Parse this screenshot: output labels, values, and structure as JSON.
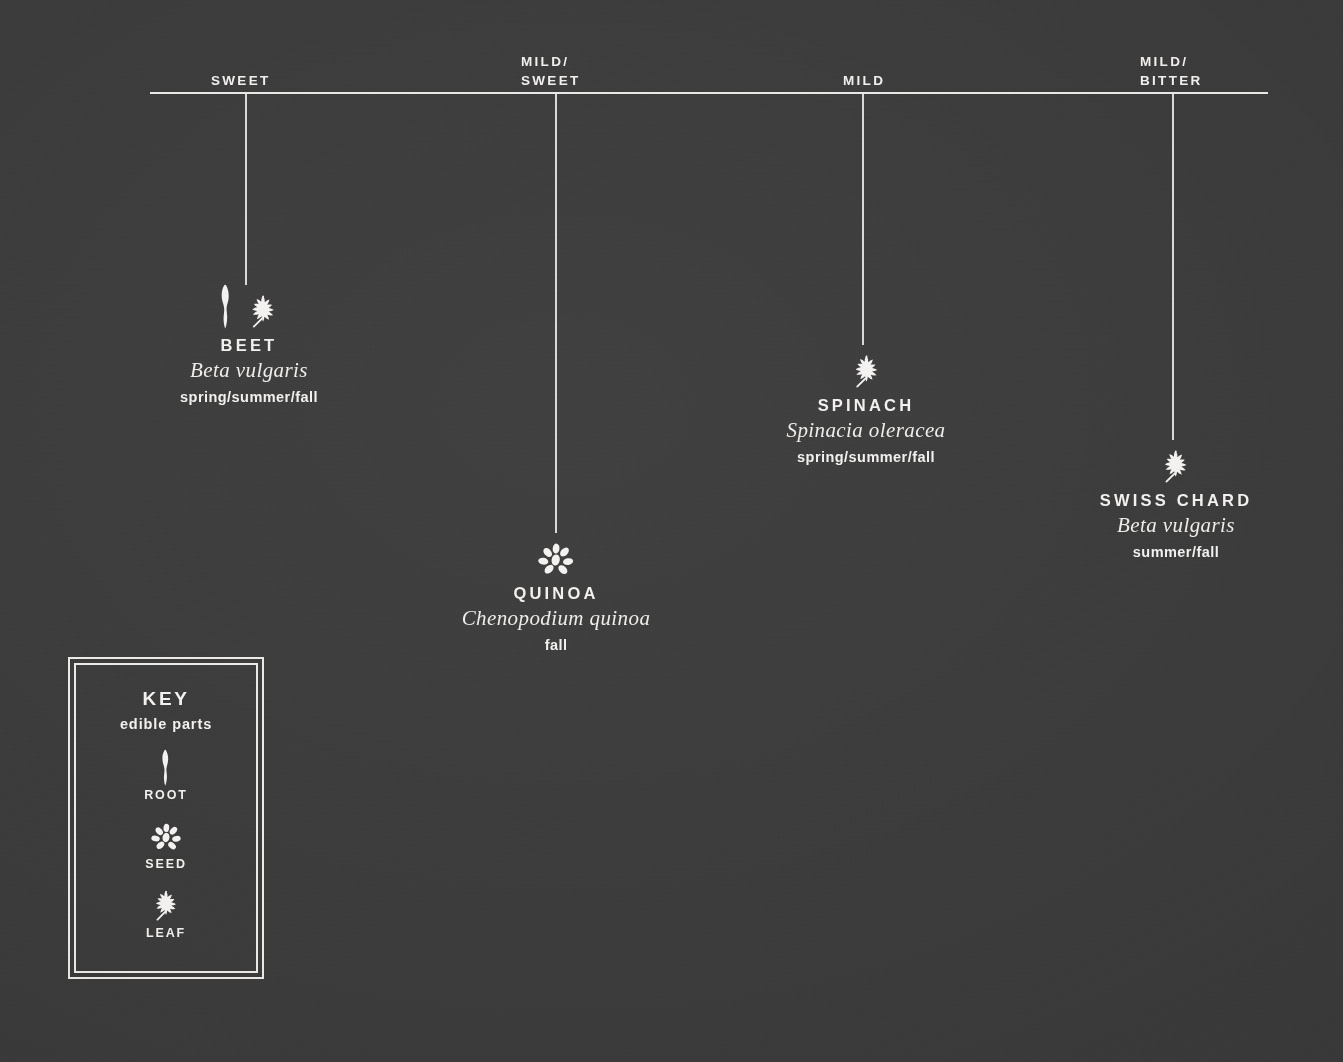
{
  "palette": {
    "background": "#3b3b3b",
    "ink": "#f2f1ef",
    "rule": "#e8e8e6"
  },
  "axis": {
    "name": "flavor-axis",
    "labels": [
      {
        "id": "sweet",
        "text": "SWEET",
        "line1": "SWEET",
        "line2": ""
      },
      {
        "id": "mild-sweet",
        "text": "MILD/ SWEET",
        "line1": "MILD/",
        "line2": "SWEET"
      },
      {
        "id": "mild",
        "text": "MILD",
        "line1": "MILD",
        "line2": ""
      },
      {
        "id": "mild-bitter",
        "text": "MILD/ BITTER",
        "line1": "MILD/",
        "line2": "BITTER"
      }
    ]
  },
  "entries": [
    {
      "id": "beet",
      "common": "BEET",
      "latin": "Beta vulgaris",
      "season": "spring/summer/fall",
      "flavor": "SWEET",
      "icons": [
        "root-icon",
        "leaf-icon"
      ]
    },
    {
      "id": "quinoa",
      "common": "QUINOA",
      "latin": "Chenopodium quinoa",
      "season": "fall",
      "flavor": "MILD/ SWEET",
      "icons": [
        "seed-icon"
      ]
    },
    {
      "id": "spinach",
      "common": "SPINACH",
      "latin": "Spinacia oleracea",
      "season": "spring/summer/fall",
      "flavor": "MILD",
      "icons": [
        "leaf-icon"
      ]
    },
    {
      "id": "swiss-chard",
      "common": "SWISS CHARD",
      "latin": "Beta vulgaris",
      "season": "summer/fall",
      "flavor": "MILD/ BITTER",
      "icons": [
        "leaf-icon"
      ]
    }
  ],
  "key": {
    "title": "KEY",
    "subtitle": "edible parts",
    "items": [
      {
        "id": "root",
        "label": "ROOT",
        "icon": "root-icon"
      },
      {
        "id": "seed",
        "label": "SEED",
        "icon": "seed-icon"
      },
      {
        "id": "leaf",
        "label": "LEAF",
        "icon": "leaf-icon"
      }
    ]
  }
}
